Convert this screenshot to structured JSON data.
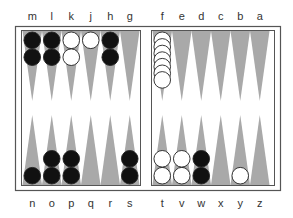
{
  "board": {
    "colors": {
      "frame": "#555555",
      "board_bg": "#ffffff",
      "point": "#a9a9a9",
      "black_checker": "#111111",
      "white_checker": "#ffffff",
      "checker_stroke": "#222222"
    },
    "top_labels": [
      "m",
      "l",
      "k",
      "j",
      "h",
      "g",
      "f",
      "e",
      "d",
      "c",
      "b",
      "a"
    ],
    "bottom_labels": [
      "n",
      "o",
      "p",
      "q",
      "r",
      "s",
      "t",
      "v",
      "w",
      "x",
      "y",
      "z"
    ],
    "top_points": [
      {
        "label": "m",
        "color": "black",
        "count": 2
      },
      {
        "label": "l",
        "color": "black",
        "count": 2
      },
      {
        "label": "k",
        "color": "white",
        "count": 2
      },
      {
        "label": "j",
        "color": "white",
        "count": 1
      },
      {
        "label": "h",
        "color": "black",
        "count": 2
      },
      {
        "label": "g",
        "color": "none",
        "count": 0
      },
      {
        "label": "f",
        "color": "white",
        "count": 7
      },
      {
        "label": "e",
        "color": "none",
        "count": 0
      },
      {
        "label": "d",
        "color": "none",
        "count": 0
      },
      {
        "label": "c",
        "color": "none",
        "count": 0
      },
      {
        "label": "b",
        "color": "none",
        "count": 0
      },
      {
        "label": "a",
        "color": "none",
        "count": 0
      }
    ],
    "bottom_points": [
      {
        "label": "n",
        "color": "black",
        "count": 1
      },
      {
        "label": "o",
        "color": "black",
        "count": 2
      },
      {
        "label": "p",
        "color": "black",
        "count": 2
      },
      {
        "label": "q",
        "color": "none",
        "count": 0
      },
      {
        "label": "r",
        "color": "none",
        "count": 0
      },
      {
        "label": "s",
        "color": "black",
        "count": 2
      },
      {
        "label": "t",
        "color": "white",
        "count": 2
      },
      {
        "label": "v",
        "color": "white",
        "count": 2
      },
      {
        "label": "w",
        "color": "black",
        "count": 2
      },
      {
        "label": "x",
        "color": "none",
        "count": 0
      },
      {
        "label": "y",
        "color": "white",
        "count": 1
      },
      {
        "label": "z",
        "color": "none",
        "count": 0
      }
    ]
  }
}
